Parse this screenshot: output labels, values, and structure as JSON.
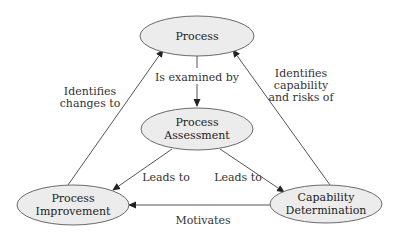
{
  "diagram": {
    "nodes": {
      "process": {
        "lines": [
          "Process"
        ]
      },
      "assessment": {
        "lines": [
          "Process",
          "Assessment"
        ]
      },
      "improvement": {
        "lines": [
          "Process",
          "Improvement"
        ]
      },
      "capability": {
        "lines": [
          "Capability",
          "Determination"
        ]
      }
    },
    "edges": {
      "examined": {
        "from": "Process",
        "to": "Process Assessment",
        "lines": [
          "Is examined by"
        ]
      },
      "identifies_changes": {
        "from": "Process Improvement",
        "to": "Process",
        "lines": [
          "Identifies",
          "changes to"
        ]
      },
      "identifies_capability": {
        "from": "Capability Determination",
        "to": "Process",
        "lines": [
          "Identifies",
          "capability",
          "and risks of"
        ]
      },
      "leads_improvement": {
        "from": "Process Assessment",
        "to": "Process Improvement",
        "lines": [
          "Leads to"
        ]
      },
      "leads_capability": {
        "from": "Process Assessment",
        "to": "Capability Determination",
        "lines": [
          "Leads to"
        ]
      },
      "motivates": {
        "from": "Capability Determination",
        "to": "Process Improvement",
        "lines": [
          "Motivates"
        ]
      }
    }
  }
}
